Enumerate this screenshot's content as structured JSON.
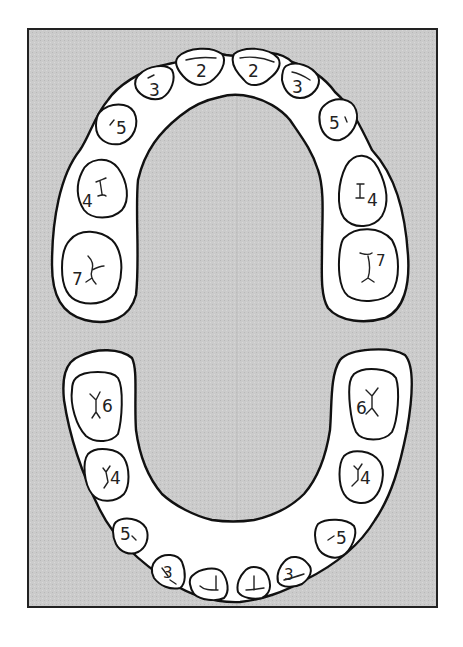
{
  "diagram": {
    "type": "dental arch chart",
    "background_color": "#c9c9c9",
    "border_color": "#222222",
    "arch_color": "#ffffff",
    "upper_arch": {
      "teeth": [
        {
          "position": "upper-left-molar",
          "label": "7"
        },
        {
          "position": "upper-left-premolar",
          "label": "4"
        },
        {
          "position": "upper-left-canine",
          "label": "5"
        },
        {
          "position": "upper-left-lateral-incisor",
          "label": "3"
        },
        {
          "position": "upper-left-central-incisor",
          "label": "2"
        },
        {
          "position": "upper-right-central-incisor",
          "label": "2"
        },
        {
          "position": "upper-right-lateral-incisor",
          "label": "3"
        },
        {
          "position": "upper-right-canine",
          "label": "5"
        },
        {
          "position": "upper-right-premolar",
          "label": "4"
        },
        {
          "position": "upper-right-molar",
          "label": "7"
        }
      ]
    },
    "lower_arch": {
      "teeth": [
        {
          "position": "lower-left-molar",
          "label": "6"
        },
        {
          "position": "lower-left-premolar",
          "label": "4"
        },
        {
          "position": "lower-left-canine",
          "label": "5"
        },
        {
          "position": "lower-left-lateral-incisor",
          "label": "3"
        },
        {
          "position": "lower-left-central-incisor",
          "label": "1"
        },
        {
          "position": "lower-right-central-incisor",
          "label": "1"
        },
        {
          "position": "lower-right-lateral-incisor",
          "label": "3"
        },
        {
          "position": "lower-right-canine",
          "label": "5"
        },
        {
          "position": "lower-right-premolar",
          "label": "4"
        },
        {
          "position": "lower-right-molar",
          "label": "6"
        }
      ]
    }
  }
}
